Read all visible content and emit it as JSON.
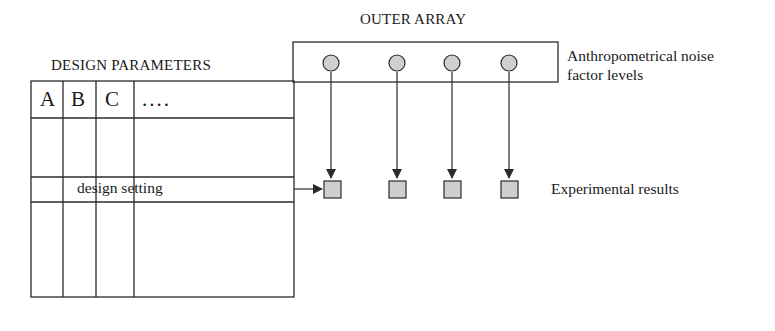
{
  "diagram": {
    "outer_array": {
      "title": "OUTER ARRAY",
      "noise_label_line1": "Anthropometrical noise",
      "noise_label_line2": "factor levels",
      "noise_levels": [
        "level-1",
        "level-2",
        "level-3",
        "level-4"
      ]
    },
    "design_parameters": {
      "title": "DESIGN PARAMETERS",
      "columns": [
        "A",
        "B",
        "C",
        "...."
      ],
      "row_label": "design setting"
    },
    "results": {
      "label": "Experimental results",
      "count": 4
    },
    "colors": {
      "line": "#2a2a2a",
      "node_fill": "#cfcfcf",
      "background": "#ffffff"
    }
  }
}
